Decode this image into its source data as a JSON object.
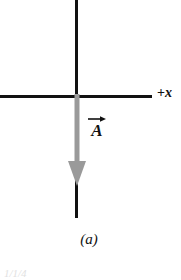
{
  "figure": {
    "panel_label": "(a)",
    "background_color": "#ffffff",
    "width": 181,
    "height": 280
  },
  "axes": {
    "x_axis": {
      "label": "+x",
      "label_sign": "+",
      "label_variable": "x",
      "color": "#111111",
      "orientation": "horizontal"
    },
    "y_axis": {
      "label": "",
      "color": "#111111",
      "orientation": "vertical"
    }
  },
  "vector": {
    "name": "A",
    "label_glyph": "A",
    "notation": "overhead-arrow",
    "direction": "down",
    "color": "#9a9a9a",
    "arrowhead": "filled-triangle"
  },
  "icons": {
    "down-arrow-icon": "vector-arrow-pointing-down",
    "right-arrow-icon": "vector-notation-arrow"
  },
  "clipped": {
    "fragment": "1/1/4"
  }
}
